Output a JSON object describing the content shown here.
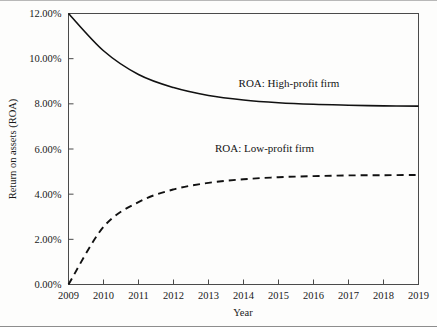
{
  "chart_data": {
    "type": "line",
    "title": "",
    "xlabel": "Year",
    "ylabel": "Return on assets (ROA)",
    "xlim": [
      2009,
      2019
    ],
    "ylim": [
      0,
      12
    ],
    "grid": false,
    "legend_position": "inline-annotation",
    "x": [
      2009,
      2010,
      2011,
      2012,
      2013,
      2014,
      2015,
      2016,
      2017,
      2018,
      2019
    ],
    "xtick_labels": [
      "2009",
      "2010",
      "2011",
      "2012",
      "2013",
      "2014",
      "2015",
      "2016",
      "2017",
      "2018",
      "2019"
    ],
    "ytick_values": [
      0,
      2,
      4,
      6,
      8,
      10,
      12
    ],
    "ytick_labels": [
      "0.00%",
      "2.00%",
      "4.00%",
      "6.00%",
      "8.00%",
      "10.00%",
      "12.00%"
    ],
    "series": [
      {
        "name": "ROA: High-profit firm",
        "style": "solid",
        "values": [
          12.0,
          10.35,
          9.3,
          8.72,
          8.37,
          8.17,
          8.05,
          7.98,
          7.94,
          7.91,
          7.9
        ]
      },
      {
        "name": "ROA: Low-profit firm",
        "style": "dashed",
        "values": [
          0.0,
          2.55,
          3.65,
          4.21,
          4.5,
          4.66,
          4.75,
          4.8,
          4.83,
          4.84,
          4.85
        ]
      }
    ],
    "annotations": [
      {
        "text": "ROA: High-profit firm",
        "x": 2015.3,
        "y": 8.75
      },
      {
        "text": "ROA: Low-profit firm",
        "x": 2014.6,
        "y": 5.85
      }
    ],
    "colors": {
      "series_line": "#111111",
      "axis": "#4a4a4a",
      "text": "#1a1a1a",
      "background": "#fdfdfc",
      "outer_border": "#8d8d8d"
    }
  }
}
